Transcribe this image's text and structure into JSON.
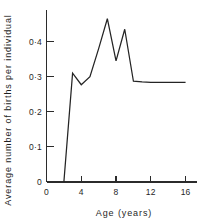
{
  "chart_data": {
    "type": "line",
    "title": "",
    "xlabel": "Age (years)",
    "ylabel": "Average number of births per individual",
    "xlim": [
      0,
      17.2
    ],
    "ylim": [
      0,
      0.487
    ],
    "grid": false,
    "legend": null,
    "line_color": "#242424",
    "x": [
      2,
      3,
      4,
      5,
      6,
      7,
      8,
      9,
      10,
      11,
      12,
      13,
      14,
      15,
      16
    ],
    "values": [
      0.0,
      0.31,
      0.277,
      0.3,
      0.38,
      0.465,
      0.345,
      0.435,
      0.287,
      0.285,
      0.284,
      0.284,
      0.284,
      0.284,
      0.284
    ],
    "xticks": [
      0,
      4,
      8,
      12,
      16
    ],
    "xticklabels": [
      "0",
      "4",
      "8",
      "12",
      "16"
    ],
    "yticks": [
      0,
      0.1,
      0.2,
      0.3,
      0.4
    ],
    "yticklabels": [
      "0",
      "0·1",
      "0·2",
      "0·3",
      "0·4"
    ]
  }
}
